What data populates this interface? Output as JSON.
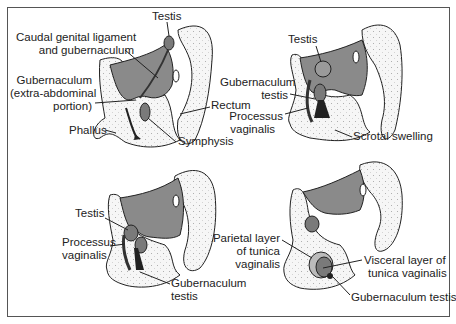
{
  "figure": {
    "colors": {
      "border": "#555555",
      "peritoneal_cavity": "#8a8a8a",
      "tissue_fill": "#f4f4f4",
      "outline": "#222222",
      "testis": "#7a7a7a"
    },
    "panels": [
      {
        "id": "panel-1",
        "labels": {
          "testis": "Testis",
          "caudal_1": "Caudal genital ligament",
          "caudal_2": "and gubernaculum",
          "guber_1": "Gubernaculum",
          "guber_2": "(extra-abdominal",
          "guber_3": "portion)",
          "phallus": "Phallus",
          "symphysis": "Symphysis",
          "rectum": "Rectum"
        }
      },
      {
        "id": "panel-2",
        "labels": {
          "testis": "Testis",
          "guber_1": "Gubernaculum",
          "guber_2": "testis",
          "proc_1": "Processus",
          "proc_2": "vaginalis",
          "scrotal": "Scrotal swelling"
        }
      },
      {
        "id": "panel-3",
        "labels": {
          "testis": "Testis",
          "proc_1": "Processus",
          "proc_2": "vaginalis",
          "guber_1": "Gubernaculum",
          "guber_2": "testis"
        }
      },
      {
        "id": "panel-4",
        "labels": {
          "parietal_1": "Parietal layer",
          "parietal_2": "of tunica",
          "parietal_3": "vaginalis",
          "visceral_1": "Visceral layer of",
          "visceral_2": "tunica vaginalis",
          "guber": "Gubernaculum testis"
        }
      }
    ]
  }
}
